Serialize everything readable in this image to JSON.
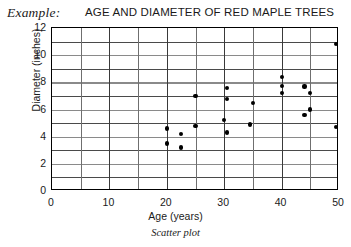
{
  "header": {
    "example_label": "Example:",
    "title": "AGE AND DIAMETER OF RED MAPLE TREES"
  },
  "caption": "Scatter plot",
  "colors": {
    "point": "#000000",
    "frame": "#000000",
    "grid_minor": "#4a4a4a",
    "grid_major": "#8a8a8a",
    "background": "#ffffff",
    "text": "#1a1a1a"
  },
  "chart_data": {
    "type": "scatter",
    "title": "AGE AND DIAMETER OF RED MAPLE TREES",
    "xlabel": "Age (years)",
    "ylabel": "Diameter (inches)",
    "xlim": [
      0,
      50
    ],
    "ylim": [
      0,
      12
    ],
    "xticks": [
      0,
      10,
      20,
      30,
      40,
      50
    ],
    "xtick_labels": [
      "0",
      "10",
      "20",
      "30",
      "40",
      "50"
    ],
    "yticks": [
      0,
      2,
      4,
      6,
      8,
      10,
      12
    ],
    "ytick_labels": [
      "0",
      "2",
      "4",
      "6",
      "8",
      "10",
      "12"
    ],
    "x_gridlines_minor_step": 5,
    "y_gridlines_minor_step": 1,
    "grid": true,
    "legend": false,
    "marker": "filled-circle",
    "points": [
      {
        "x": 20.0,
        "y": 4.6
      },
      {
        "x": 20.0,
        "y": 3.5
      },
      {
        "x": 22.5,
        "y": 4.2
      },
      {
        "x": 22.5,
        "y": 3.2
      },
      {
        "x": 25.0,
        "y": 7.0
      },
      {
        "x": 25.0,
        "y": 4.8
      },
      {
        "x": 30.0,
        "y": 5.2
      },
      {
        "x": 30.5,
        "y": 7.6
      },
      {
        "x": 30.5,
        "y": 6.8
      },
      {
        "x": 30.5,
        "y": 4.3
      },
      {
        "x": 34.5,
        "y": 4.9
      },
      {
        "x": 35.0,
        "y": 6.5
      },
      {
        "x": 40.0,
        "y": 8.4
      },
      {
        "x": 40.0,
        "y": 7.75
      },
      {
        "x": 40.0,
        "y": 7.2
      },
      {
        "x": 44.0,
        "y": 7.7
      },
      {
        "x": 44.0,
        "y": 5.6
      },
      {
        "x": 45.0,
        "y": 7.2
      },
      {
        "x": 45.0,
        "y": 6.0
      },
      {
        "x": 49.5,
        "y": 10.8
      },
      {
        "x": 49.5,
        "y": 4.7
      }
    ]
  }
}
